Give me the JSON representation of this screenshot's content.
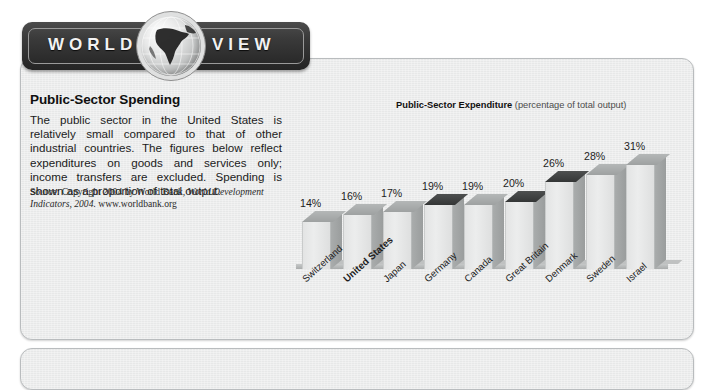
{
  "banner": {
    "word_left": "WORLD",
    "word_right": "VIEW",
    "globe_icon": "globe-africa-icon"
  },
  "article": {
    "headline": "Public-Sector Spending",
    "body": "The public sector in the United States is relatively small compared to that of other industrial countries. The figures below reflect expenditures on goods and services only; income transfers are excluded. Spending is shown as a proportion of total output.",
    "source_prefix": "Source: Copyright 2004 by World Bank, ",
    "source_italic": "World Development Indicators, 2004.",
    "source_suffix": " www.worldbank.org"
  },
  "chart_title": {
    "strong": "Public-Sector Expenditure",
    "light": " (percentage of total output)"
  },
  "chart_data": {
    "type": "bar",
    "title": "Public-Sector Expenditure (percentage of total output)",
    "xlabel": "",
    "ylabel": "percentage of total output",
    "ylim": [
      0,
      35
    ],
    "grid": false,
    "legend": "none",
    "unit": "%",
    "categories": [
      "Switzerland",
      "United States",
      "Japan",
      "Germany",
      "Canada",
      "Great Britain",
      "Denmark",
      "Sweden",
      "Israel"
    ],
    "values": [
      14,
      16,
      17,
      19,
      19,
      20,
      26,
      28,
      31
    ],
    "data_labels": [
      "14%",
      "16%",
      "17%",
      "19%",
      "19%",
      "20%",
      "26%",
      "28%",
      "31%"
    ],
    "highlighted_category": "United States",
    "dark_top_categories": [
      "Germany",
      "Great Britain",
      "Denmark"
    ],
    "colors": {
      "bar_face": "#e8e9e9",
      "bar_side": "#a0a3a3",
      "bar_top": "#a9acac",
      "bar_top_dark": "#3b3d3d",
      "panel_bg": "#eceded",
      "banner_bg": "#2c2c2c",
      "text": "#1b1b1b"
    }
  }
}
